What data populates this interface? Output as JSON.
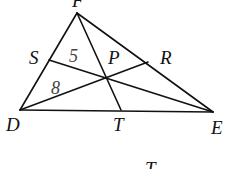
{
  "diagram": {
    "type": "triangle with cevians",
    "line_color": "#111111",
    "vertices": [
      {
        "id": "F",
        "label": "F",
        "x": 77,
        "y": 13,
        "label_x": 72,
        "label_y": 7
      },
      {
        "id": "D",
        "label": "D",
        "x": 20,
        "y": 110,
        "label_x": 6,
        "label_y": 131
      },
      {
        "id": "E",
        "label": "E",
        "x": 213,
        "y": 112,
        "label_x": 211,
        "label_y": 134
      }
    ],
    "points": [
      {
        "id": "S",
        "label": "S",
        "x": 49,
        "y": 60,
        "label_x": 30,
        "label_y": 64
      },
      {
        "id": "R",
        "label": "R",
        "x": 148,
        "y": 62,
        "label_x": 160,
        "label_y": 64
      },
      {
        "id": "P",
        "label": "P",
        "x": 106,
        "y": 77,
        "label_x": 108,
        "label_y": 64
      },
      {
        "id": "T",
        "label": "T",
        "x": 121,
        "y": 110,
        "label_x": 113,
        "label_y": 131
      }
    ],
    "segments": [
      [
        "F",
        "D"
      ],
      [
        "F",
        "E"
      ],
      [
        "D",
        "E"
      ],
      [
        "F",
        "T"
      ],
      [
        "S",
        "E"
      ],
      [
        "D",
        "R"
      ]
    ],
    "measures": [
      {
        "label": "5",
        "segment": "SP",
        "x": 68,
        "y": 64
      },
      {
        "label": "8",
        "segment": "DP",
        "x": 51,
        "y": 94
      }
    ],
    "extra_labels": [
      {
        "label": "T",
        "x": 144,
        "y": 167
      }
    ]
  }
}
